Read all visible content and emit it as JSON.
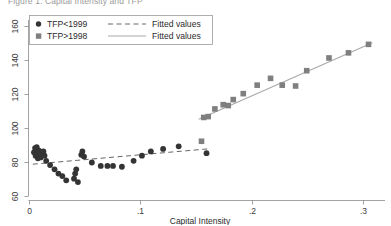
{
  "figure": {
    "title": "Figure 1. Capital Intensity and TFP"
  },
  "legend": {
    "position": "top-left",
    "entries": [
      {
        "marker": "circle-marker",
        "label": "TFP<1999",
        "line": "dashed-line",
        "line_label": "Fitted values"
      },
      {
        "marker": "square-marker",
        "label": "TFP>1998",
        "line": "solid-line",
        "line_label": "Fitted values"
      }
    ]
  },
  "axes": {
    "x": {
      "title": "Capital Intensity",
      "ticks": [
        "0",
        ".1",
        ".2",
        ".3"
      ],
      "tick_values": [
        0,
        0.1,
        0.2,
        0.3
      ]
    },
    "y": {
      "title": "",
      "ticks": [
        "60",
        "80",
        "100",
        "120",
        "140",
        "160"
      ],
      "tick_values": [
        60,
        80,
        100,
        120,
        140,
        160
      ]
    }
  },
  "colors": {
    "circle_marker": "#343434",
    "square_marker": "#7f7f7f",
    "dashed_fit": "#555555",
    "solid_fit": "#a9a9a9",
    "axis": "#8c8c8c",
    "background": "#ffffff"
  },
  "chart_data": {
    "type": "scatter",
    "title": "Figure 1. Capital Intensity and TFP",
    "xlabel": "Capital Intensity",
    "ylabel": "",
    "xlim": [
      -0.004,
      0.325
    ],
    "ylim": [
      55,
      168
    ],
    "grid": false,
    "legend_position": "top-left",
    "series": [
      {
        "name": "TFP<1999",
        "marker": "circle",
        "color": "#343434",
        "points": [
          [
            0.004,
            86.0
          ],
          [
            0.005,
            88.5
          ],
          [
            0.0055,
            84.0
          ],
          [
            0.006,
            86.5
          ],
          [
            0.0065,
            89.0
          ],
          [
            0.007,
            85.0
          ],
          [
            0.0075,
            82.5
          ],
          [
            0.0085,
            87.0
          ],
          [
            0.009,
            84.5
          ],
          [
            0.01,
            83.0
          ],
          [
            0.0125,
            86.5
          ],
          [
            0.0135,
            84.0
          ],
          [
            0.015,
            81.0
          ],
          [
            0.0185,
            78.5
          ],
          [
            0.0225,
            76.0
          ],
          [
            0.026,
            73.5
          ],
          [
            0.0295,
            72.0
          ],
          [
            0.033,
            69.5
          ],
          [
            0.04,
            70.5
          ],
          [
            0.041,
            73.5
          ],
          [
            0.042,
            76.0
          ],
          [
            0.0435,
            68.5
          ],
          [
            0.0465,
            84.5
          ],
          [
            0.0475,
            86.5
          ],
          [
            0.049,
            83.5
          ],
          [
            0.056,
            80.0
          ],
          [
            0.064,
            78.0
          ],
          [
            0.07,
            78.0
          ],
          [
            0.075,
            78.0
          ],
          [
            0.083,
            77.5
          ],
          [
            0.0935,
            81.0
          ],
          [
            0.101,
            84.0
          ],
          [
            0.109,
            86.5
          ],
          [
            0.12,
            88.0
          ],
          [
            0.134,
            89.5
          ],
          [
            0.159,
            85.5
          ]
        ],
        "fit": {
          "type": "dashed",
          "x": [
            0.003,
            0.16
          ],
          "y": [
            79.0,
            88.0
          ]
        }
      },
      {
        "name": "TFP>1998",
        "marker": "square",
        "color": "#7f7f7f",
        "points": [
          [
            0.1545,
            92.5
          ],
          [
            0.1565,
            106.5
          ],
          [
            0.1605,
            107.0
          ],
          [
            0.1665,
            111.5
          ],
          [
            0.174,
            114.0
          ],
          [
            0.1785,
            113.5
          ],
          [
            0.183,
            117.0
          ],
          [
            0.192,
            120.5
          ],
          [
            0.2045,
            125.5
          ],
          [
            0.2165,
            129.5
          ],
          [
            0.227,
            125.5
          ],
          [
            0.239,
            125.0
          ],
          [
            0.249,
            134.0
          ],
          [
            0.269,
            141.5
          ],
          [
            0.2865,
            144.5
          ],
          [
            0.3045,
            149.5
          ]
        ],
        "fit": {
          "type": "solid",
          "x": [
            0.152,
            0.308
          ],
          "y": [
            105.5,
            150.5
          ]
        }
      }
    ]
  }
}
